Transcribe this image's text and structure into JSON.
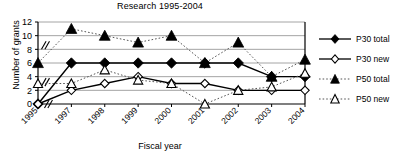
{
  "chart_data": {
    "type": "line",
    "title": "Research 1995-2004",
    "xlabel": "Fiscal year",
    "ylabel": "Number of grants",
    "categories": [
      "1995",
      "1997",
      "1998",
      "1999",
      "2000",
      "2001",
      "2002",
      "2003",
      "2004"
    ],
    "ylim": [
      0,
      12
    ],
    "yticks": [
      0,
      2,
      4,
      6,
      8,
      10,
      12
    ],
    "grid": true,
    "axis_break": "x-axis break between 1995 and 1997 (1996 omitted)",
    "legend_position": "right",
    "series": [
      {
        "name": "P30 total",
        "marker": "filled-diamond",
        "line": "solid",
        "color": "#000000",
        "values": [
          0,
          6,
          6,
          6,
          6,
          6,
          6,
          4,
          4
        ]
      },
      {
        "name": "P30 new",
        "marker": "open-diamond",
        "line": "solid",
        "color": "#000000",
        "values": [
          0,
          2,
          3,
          4,
          3,
          3,
          2,
          2,
          2
        ]
      },
      {
        "name": "P50 total",
        "marker": "filled-triangle",
        "line": "dotted",
        "color": "#000000",
        "values": [
          6,
          11,
          10,
          9,
          10,
          6,
          9,
          4,
          6.5
        ]
      },
      {
        "name": "P50 new",
        "marker": "open-triangle",
        "line": "dotted",
        "color": "#000000",
        "values": [
          3,
          3,
          5,
          3.5,
          3,
          0,
          2,
          2.5,
          4.5
        ]
      }
    ]
  },
  "legend": {
    "items": [
      {
        "label": "P30 total",
        "marker": "filled-diamond",
        "line": "solid"
      },
      {
        "label": "P30 new",
        "marker": "open-diamond",
        "line": "solid"
      },
      {
        "label": "P50 total",
        "marker": "filled-triangle",
        "line": "dotted"
      },
      {
        "label": "P50 new",
        "marker": "open-triangle",
        "line": "dotted"
      }
    ]
  }
}
